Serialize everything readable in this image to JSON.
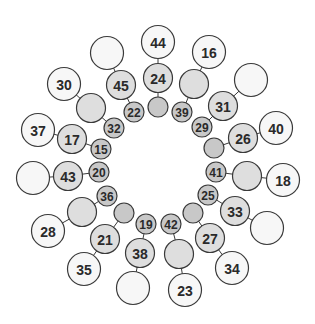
{
  "diagram": {
    "center": [
      158,
      168
    ],
    "colors": {
      "inner": "#c8c8c8",
      "middle": "#dedede",
      "outer": "#f7f7f7",
      "stroke": "#3a3a3a",
      "text": "#2a2a2a"
    },
    "radii": {
      "inner": 10,
      "middle": 14.5,
      "outer": 16.5
    },
    "font_sizes": {
      "inner": 12,
      "middle": 14,
      "outer": 14
    },
    "spokes": [
      {
        "inner": {
          "x": 158,
          "y": 107,
          "label": ""
        },
        "middle": {
          "x": 158,
          "y": 78,
          "label": "24"
        },
        "outer": {
          "x": 158,
          "y": 42,
          "label": "44"
        }
      },
      {
        "inner": {
          "x": 182,
          "y": 112,
          "label": "39"
        },
        "middle": {
          "x": 194,
          "y": 84,
          "label": ""
        },
        "outer": {
          "x": 209,
          "y": 52,
          "label": "16"
        }
      },
      {
        "inner": {
          "x": 202,
          "y": 127,
          "label": "29"
        },
        "middle": {
          "x": 223,
          "y": 106,
          "label": "31"
        },
        "outer": {
          "x": 251,
          "y": 80,
          "label": ""
        }
      },
      {
        "inner": {
          "x": 214,
          "y": 148,
          "label": ""
        },
        "middle": {
          "x": 243,
          "y": 138,
          "label": "26"
        },
        "outer": {
          "x": 276,
          "y": 128,
          "label": "40"
        }
      },
      {
        "inner": {
          "x": 216,
          "y": 172,
          "label": "41"
        },
        "middle": {
          "x": 247,
          "y": 176,
          "label": ""
        },
        "outer": {
          "x": 283,
          "y": 180,
          "label": "18"
        }
      },
      {
        "inner": {
          "x": 208,
          "y": 195,
          "label": "25"
        },
        "middle": {
          "x": 235,
          "y": 211,
          "label": "33"
        },
        "outer": {
          "x": 267,
          "y": 228,
          "label": ""
        }
      },
      {
        "inner": {
          "x": 193,
          "y": 213,
          "label": ""
        },
        "middle": {
          "x": 210,
          "y": 238,
          "label": "27"
        },
        "outer": {
          "x": 232,
          "y": 268,
          "label": "34"
        }
      },
      {
        "inner": {
          "x": 171,
          "y": 224,
          "label": "42"
        },
        "middle": {
          "x": 179,
          "y": 254,
          "label": ""
        },
        "outer": {
          "x": 185,
          "y": 290,
          "label": "23"
        }
      },
      {
        "inner": {
          "x": 146,
          "y": 224,
          "label": "19"
        },
        "middle": {
          "x": 140,
          "y": 253,
          "label": "38"
        },
        "outer": {
          "x": 133,
          "y": 288,
          "label": ""
        }
      },
      {
        "inner": {
          "x": 124,
          "y": 213,
          "label": ""
        },
        "middle": {
          "x": 105,
          "y": 239,
          "label": "21"
        },
        "outer": {
          "x": 84,
          "y": 269,
          "label": "35"
        }
      },
      {
        "inner": {
          "x": 107,
          "y": 196,
          "label": "36"
        },
        "middle": {
          "x": 82,
          "y": 212,
          "label": ""
        },
        "outer": {
          "x": 48,
          "y": 231,
          "label": "28"
        }
      },
      {
        "inner": {
          "x": 99,
          "y": 172,
          "label": "20"
        },
        "middle": {
          "x": 68,
          "y": 176,
          "label": "43"
        },
        "outer": {
          "x": 33,
          "y": 178,
          "label": ""
        }
      },
      {
        "inner": {
          "x": 101,
          "y": 149,
          "label": "15"
        },
        "middle": {
          "x": 72,
          "y": 139,
          "label": "17"
        },
        "outer": {
          "x": 38,
          "y": 130,
          "label": "37"
        }
      },
      {
        "inner": {
          "x": 114,
          "y": 128,
          "label": "32"
        },
        "middle": {
          "x": 91,
          "y": 108,
          "label": ""
        },
        "outer": {
          "x": 64,
          "y": 84,
          "label": "30"
        }
      },
      {
        "inner": {
          "x": 134,
          "y": 112,
          "label": "22"
        },
        "middle": {
          "x": 121,
          "y": 85,
          "label": "45"
        },
        "outer": {
          "x": 107,
          "y": 53,
          "label": ""
        }
      }
    ]
  }
}
